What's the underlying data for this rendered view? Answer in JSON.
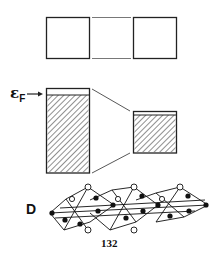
{
  "figure": {
    "panel_label": "D",
    "fermi_label": "ε",
    "fermi_sub": "F",
    "page_number": "132",
    "colors": {
      "ink": "#222222",
      "background": "#ffffff"
    }
  }
}
